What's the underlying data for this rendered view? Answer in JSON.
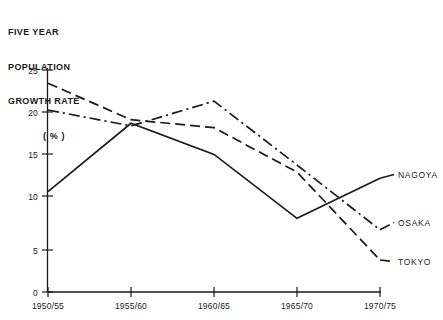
{
  "chart_data": {
    "type": "line",
    "title_lines": [
      "FIVE YEAR",
      "POPULATION",
      "GROWTH RATE"
    ],
    "unit_label": "( % )",
    "xlabel": "",
    "ylabel": "FIVE YEAR POPULATION GROWTH RATE (%)",
    "categories": [
      "1950/55",
      "1955/60",
      "1960/65",
      "1965/70",
      "1970/75"
    ],
    "ylim": [
      0,
      25
    ],
    "yticks": [
      0,
      5,
      10,
      15,
      20,
      25
    ],
    "ytick_labels": [
      "0",
      "5",
      "10",
      "15",
      "20",
      "25"
    ],
    "grid": false,
    "legend_position": "right-inline",
    "series": [
      {
        "name": "NAGOYA",
        "style": "solid",
        "values": [
          11.3,
          19.0,
          15.5,
          8.3,
          12.8
        ]
      },
      {
        "name": "OSAKA",
        "style": "dash-dot",
        "values": [
          20.5,
          18.7,
          21.5,
          14.3,
          7.0
        ]
      },
      {
        "name": "TOKYO",
        "style": "dashed",
        "values": [
          23.5,
          19.4,
          18.5,
          13.5,
          3.6
        ]
      }
    ]
  },
  "axis": {
    "y_tick_labels": [
      "25",
      "20",
      "15",
      "10",
      "5",
      "0"
    ],
    "x_tick_labels": [
      "1950/55",
      "1955/60",
      "1960/65",
      "1965/70",
      "1970/75"
    ]
  },
  "legend": {
    "items": [
      {
        "label": "NAGOYA"
      },
      {
        "label": "OSAKA"
      },
      {
        "label": "TOKYO"
      }
    ]
  },
  "colors": {
    "ink": "#1a1a1a",
    "background": "#ffffff"
  }
}
